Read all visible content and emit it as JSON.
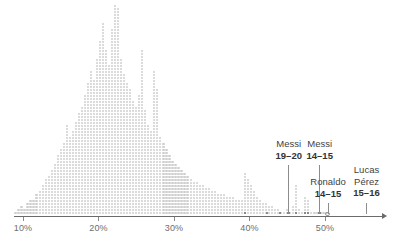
{
  "chart_data": {
    "type": "scatter",
    "title": "",
    "subtitle": "",
    "xlabel": "",
    "ylabel": "",
    "xlim": [
      7.5,
      57.5
    ],
    "ylim": [
      0,
      72
    ],
    "grid": false,
    "legend": null,
    "unit": "percent",
    "bin_width": 0.4,
    "x_ticks": [
      10,
      20,
      30,
      40,
      50
    ],
    "x_tick_labels": [
      "10%",
      "20%",
      "30%",
      "40%",
      "50%"
    ],
    "bins": [
      {
        "x": 9.0,
        "count": 1
      },
      {
        "x": 9.4,
        "count": 2
      },
      {
        "x": 9.8,
        "count": 3
      },
      {
        "x": 10.2,
        "count": 2
      },
      {
        "x": 10.6,
        "count": 4
      },
      {
        "x": 11.0,
        "count": 5
      },
      {
        "x": 11.4,
        "count": 5
      },
      {
        "x": 11.8,
        "count": 7
      },
      {
        "x": 12.2,
        "count": 8
      },
      {
        "x": 12.6,
        "count": 10
      },
      {
        "x": 13.0,
        "count": 12
      },
      {
        "x": 13.4,
        "count": 13
      },
      {
        "x": 13.8,
        "count": 15
      },
      {
        "x": 14.2,
        "count": 17
      },
      {
        "x": 14.6,
        "count": 20
      },
      {
        "x": 15.0,
        "count": 22
      },
      {
        "x": 15.4,
        "count": 24
      },
      {
        "x": 15.8,
        "count": 30
      },
      {
        "x": 16.2,
        "count": 26
      },
      {
        "x": 16.6,
        "count": 28
      },
      {
        "x": 17.0,
        "count": 31
      },
      {
        "x": 17.4,
        "count": 34
      },
      {
        "x": 17.8,
        "count": 36
      },
      {
        "x": 18.2,
        "count": 40
      },
      {
        "x": 18.6,
        "count": 44
      },
      {
        "x": 19.0,
        "count": 48
      },
      {
        "x": 19.4,
        "count": 45
      },
      {
        "x": 19.8,
        "count": 52
      },
      {
        "x": 20.2,
        "count": 58
      },
      {
        "x": 20.6,
        "count": 64
      },
      {
        "x": 21.0,
        "count": 55
      },
      {
        "x": 21.4,
        "count": 50
      },
      {
        "x": 21.8,
        "count": 62
      },
      {
        "x": 22.2,
        "count": 70
      },
      {
        "x": 22.6,
        "count": 69
      },
      {
        "x": 23.0,
        "count": 52
      },
      {
        "x": 23.4,
        "count": 47
      },
      {
        "x": 23.8,
        "count": 44
      },
      {
        "x": 24.2,
        "count": 42
      },
      {
        "x": 24.6,
        "count": 38
      },
      {
        "x": 25.0,
        "count": 36
      },
      {
        "x": 25.4,
        "count": 40
      },
      {
        "x": 25.8,
        "count": 55
      },
      {
        "x": 26.2,
        "count": 35
      },
      {
        "x": 26.6,
        "count": 30
      },
      {
        "x": 27.0,
        "count": 28
      },
      {
        "x": 27.4,
        "count": 48
      },
      {
        "x": 27.8,
        "count": 42
      },
      {
        "x": 28.2,
        "count": 26
      },
      {
        "x": 28.6,
        "count": 24
      },
      {
        "x": 29.0,
        "count": 22
      },
      {
        "x": 29.4,
        "count": 20
      },
      {
        "x": 29.8,
        "count": 18
      },
      {
        "x": 30.2,
        "count": 17
      },
      {
        "x": 30.6,
        "count": 16
      },
      {
        "x": 31.0,
        "count": 15
      },
      {
        "x": 31.4,
        "count": 14
      },
      {
        "x": 31.8,
        "count": 13
      },
      {
        "x": 32.2,
        "count": 12
      },
      {
        "x": 32.6,
        "count": 11
      },
      {
        "x": 33.0,
        "count": 11
      },
      {
        "x": 33.4,
        "count": 10
      },
      {
        "x": 33.8,
        "count": 10
      },
      {
        "x": 34.2,
        "count": 9
      },
      {
        "x": 34.6,
        "count": 9
      },
      {
        "x": 35.0,
        "count": 8
      },
      {
        "x": 35.4,
        "count": 8
      },
      {
        "x": 35.8,
        "count": 7
      },
      {
        "x": 36.2,
        "count": 7
      },
      {
        "x": 36.6,
        "count": 7
      },
      {
        "x": 37.0,
        "count": 6
      },
      {
        "x": 37.4,
        "count": 6
      },
      {
        "x": 37.8,
        "count": 6
      },
      {
        "x": 38.2,
        "count": 5
      },
      {
        "x": 38.6,
        "count": 5
      },
      {
        "x": 39.0,
        "count": 5
      },
      {
        "x": 39.4,
        "count": 14
      },
      {
        "x": 39.8,
        "count": 12
      },
      {
        "x": 40.2,
        "count": 10
      },
      {
        "x": 40.6,
        "count": 8
      },
      {
        "x": 41.0,
        "count": 6
      },
      {
        "x": 41.4,
        "count": 5
      },
      {
        "x": 41.8,
        "count": 4
      },
      {
        "x": 42.2,
        "count": 4
      },
      {
        "x": 42.6,
        "count": 3
      },
      {
        "x": 43.0,
        "count": 3
      },
      {
        "x": 43.4,
        "count": 2
      },
      {
        "x": 43.8,
        "count": 2
      },
      {
        "x": 44.2,
        "count": 1
      },
      {
        "x": 44.6,
        "count": 1
      },
      {
        "x": 45.0,
        "count": 2
      },
      {
        "x": 45.4,
        "count": 1
      },
      {
        "x": 45.8,
        "count": 3
      },
      {
        "x": 46.2,
        "count": 10
      },
      {
        "x": 46.6,
        "count": 2
      },
      {
        "x": 47.0,
        "count": 1
      },
      {
        "x": 47.4,
        "count": 6
      },
      {
        "x": 47.8,
        "count": 5
      },
      {
        "x": 48.2,
        "count": 1
      },
      {
        "x": 48.6,
        "count": 1
      },
      {
        "x": 49.0,
        "count": 1
      },
      {
        "x": 49.4,
        "count": 1
      },
      {
        "x": 49.8,
        "count": 1
      },
      {
        "x": 50.2,
        "count": 1
      }
    ],
    "highlights": [
      {
        "label": "Messi 19-20",
        "x": 45.2,
        "style": "dark"
      },
      {
        "label": "Messi 14-15",
        "x": 49.3,
        "style": "dark"
      },
      {
        "label": "Ronaldo 14-15",
        "x": 50.2,
        "style": "hollow"
      },
      {
        "label": "Lucas Perez 15-16",
        "x": 55.5,
        "style": "tick"
      }
    ]
  },
  "axis": {
    "ticks": [
      {
        "value": 10,
        "label": "10%"
      },
      {
        "value": 20,
        "label": "20%"
      },
      {
        "value": 30,
        "label": "30%"
      },
      {
        "value": 40,
        "label": "40%"
      },
      {
        "value": 50,
        "label": "50%"
      }
    ]
  },
  "annotations": [
    {
      "id": "messi-19-20",
      "name": "Messi",
      "season": "19–20",
      "x": 45.2,
      "label_x": 45.2,
      "label_top": 138,
      "leader_top": 165,
      "leader_bottom": 214,
      "align": "center"
    },
    {
      "id": "messi-14-15",
      "name": "Messi",
      "season": "14–15",
      "x": 49.3,
      "label_x": 49.3,
      "label_top": 138,
      "leader_top": 165,
      "leader_bottom": 214,
      "align": "center"
    },
    {
      "id": "ronaldo-14-15",
      "name": "Ronaldo",
      "season": "14–15",
      "x": 50.4,
      "label_x": 50.4,
      "label_top": 176,
      "leader_top": 203,
      "leader_bottom": 214,
      "align": "center"
    },
    {
      "id": "lucas-perez-15-16",
      "name": "Lucas\nPérez",
      "name_line1": "Lucas",
      "name_line2": "Pérez",
      "season": "15–16",
      "x": 55.5,
      "label_x": 55.5,
      "label_top": 164,
      "leader_top": 203,
      "leader_bottom": 214,
      "align": "center"
    }
  ],
  "colors": {
    "dot": "#cfcfcf",
    "dot_highlight": "#6e6e6e",
    "axis": "#6b6b6b",
    "tick_label": "#6e6e6e",
    "annotation_name": "#3f3f3f",
    "annotation_season": "#333333",
    "leader": "#8c8c8c",
    "background": "#ffffff"
  }
}
